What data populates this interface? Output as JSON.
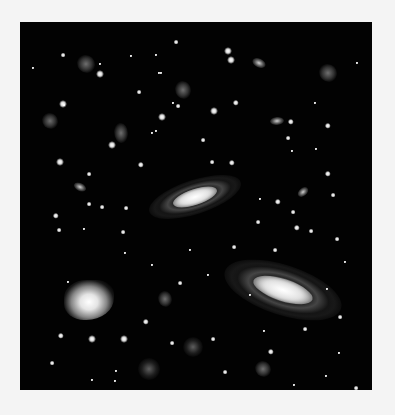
{
  "image": {
    "description": "Deep-field astronomical image of stars and galaxies on a black background",
    "panel": {
      "x": 20,
      "y": 22,
      "width": 352,
      "height": 368,
      "background": "#020202"
    },
    "border_color": "#f4f4f4"
  },
  "spiral_galaxies": [
    {
      "x": 195,
      "y": 197,
      "w": 96,
      "h": 34,
      "rot": -18,
      "core_w": 46,
      "core_h": 16
    },
    {
      "x": 283,
      "y": 290,
      "w": 122,
      "h": 50,
      "rot": 18,
      "core_w": 62,
      "core_h": 22
    }
  ],
  "small_galaxies": [
    {
      "x": 259,
      "y": 63,
      "w": 14,
      "h": 9,
      "rot": 25
    },
    {
      "x": 277,
      "y": 121,
      "w": 14,
      "h": 8,
      "rot": -5
    },
    {
      "x": 80,
      "y": 187,
      "w": 13,
      "h": 8,
      "rot": 25
    },
    {
      "x": 303,
      "y": 192,
      "w": 12,
      "h": 8,
      "rot": -40
    }
  ],
  "irregular_galaxies": [
    {
      "x": 86,
      "y": 64,
      "w": 18,
      "h": 18
    },
    {
      "x": 183,
      "y": 90,
      "w": 16,
      "h": 18
    },
    {
      "x": 328,
      "y": 73,
      "w": 18,
      "h": 18
    },
    {
      "x": 50,
      "y": 121,
      "w": 16,
      "h": 16
    },
    {
      "x": 121,
      "y": 133,
      "w": 14,
      "h": 20
    },
    {
      "x": 165,
      "y": 299,
      "w": 14,
      "h": 16
    },
    {
      "x": 263,
      "y": 369,
      "w": 16,
      "h": 16
    }
  ],
  "bright_nebula": {
    "x": 89,
    "y": 300,
    "w": 50,
    "h": 40
  },
  "diffuse_glows": [
    {
      "x": 193,
      "y": 347,
      "r": 10
    },
    {
      "x": 149,
      "y": 369,
      "r": 11
    }
  ],
  "stars": [
    {
      "x": 63,
      "y": 55,
      "s": 3
    },
    {
      "x": 131,
      "y": 56,
      "s": 2
    },
    {
      "x": 176,
      "y": 42,
      "s": 3
    },
    {
      "x": 64,
      "y": 105,
      "s": 2
    },
    {
      "x": 100,
      "y": 64,
      "s": 2
    },
    {
      "x": 228,
      "y": 51,
      "s": 5
    },
    {
      "x": 100,
      "y": 74,
      "s": 5
    },
    {
      "x": 156,
      "y": 55,
      "s": 2
    },
    {
      "x": 159,
      "y": 73,
      "s": 2
    },
    {
      "x": 231,
      "y": 60,
      "s": 5
    },
    {
      "x": 161,
      "y": 73,
      "s": 2
    },
    {
      "x": 173,
      "y": 103,
      "s": 2
    },
    {
      "x": 63,
      "y": 104,
      "s": 5
    },
    {
      "x": 139,
      "y": 92,
      "s": 3
    },
    {
      "x": 162,
      "y": 117,
      "s": 5
    },
    {
      "x": 178,
      "y": 106,
      "s": 3
    },
    {
      "x": 214,
      "y": 111,
      "s": 5
    },
    {
      "x": 236,
      "y": 103,
      "s": 4
    },
    {
      "x": 112,
      "y": 145,
      "s": 5
    },
    {
      "x": 156,
      "y": 131,
      "s": 2
    },
    {
      "x": 291,
      "y": 122,
      "s": 4
    },
    {
      "x": 288,
      "y": 138,
      "s": 3
    },
    {
      "x": 328,
      "y": 126,
      "s": 4
    },
    {
      "x": 316,
      "y": 149,
      "s": 2
    },
    {
      "x": 60,
      "y": 162,
      "s": 5
    },
    {
      "x": 89,
      "y": 174,
      "s": 3
    },
    {
      "x": 89,
      "y": 204,
      "s": 3
    },
    {
      "x": 102,
      "y": 207,
      "s": 3
    },
    {
      "x": 125,
      "y": 253,
      "s": 2
    },
    {
      "x": 56,
      "y": 216,
      "s": 4
    },
    {
      "x": 59,
      "y": 230,
      "s": 3
    },
    {
      "x": 123,
      "y": 232,
      "s": 3
    },
    {
      "x": 126,
      "y": 208,
      "s": 3
    },
    {
      "x": 141,
      "y": 165,
      "s": 4
    },
    {
      "x": 152,
      "y": 133,
      "s": 2
    },
    {
      "x": 212,
      "y": 162,
      "s": 3
    },
    {
      "x": 232,
      "y": 163,
      "s": 4
    },
    {
      "x": 203,
      "y": 140,
      "s": 3
    },
    {
      "x": 292,
      "y": 151,
      "s": 2
    },
    {
      "x": 328,
      "y": 174,
      "s": 4
    },
    {
      "x": 278,
      "y": 202,
      "s": 4
    },
    {
      "x": 293,
      "y": 212,
      "s": 3
    },
    {
      "x": 333,
      "y": 195,
      "s": 3
    },
    {
      "x": 258,
      "y": 222,
      "s": 3
    },
    {
      "x": 297,
      "y": 228,
      "s": 4
    },
    {
      "x": 311,
      "y": 231,
      "s": 3
    },
    {
      "x": 337,
      "y": 239,
      "s": 3
    },
    {
      "x": 275,
      "y": 250,
      "s": 3
    },
    {
      "x": 260,
      "y": 199,
      "s": 2
    },
    {
      "x": 234,
      "y": 247,
      "s": 3
    },
    {
      "x": 84,
      "y": 229,
      "s": 2
    },
    {
      "x": 180,
      "y": 283,
      "s": 3
    },
    {
      "x": 146,
      "y": 322,
      "s": 4
    },
    {
      "x": 172,
      "y": 343,
      "s": 3
    },
    {
      "x": 213,
      "y": 339,
      "s": 3
    },
    {
      "x": 271,
      "y": 352,
      "s": 4
    },
    {
      "x": 61,
      "y": 336,
      "s": 4
    },
    {
      "x": 92,
      "y": 339,
      "s": 5
    },
    {
      "x": 124,
      "y": 339,
      "s": 5
    },
    {
      "x": 52,
      "y": 363,
      "s": 3
    },
    {
      "x": 92,
      "y": 380,
      "s": 2
    },
    {
      "x": 116,
      "y": 371,
      "s": 2
    },
    {
      "x": 305,
      "y": 329,
      "s": 3
    },
    {
      "x": 339,
      "y": 353,
      "s": 2
    },
    {
      "x": 326,
      "y": 376,
      "s": 2
    },
    {
      "x": 356,
      "y": 388,
      "s": 3
    },
    {
      "x": 294,
      "y": 385,
      "s": 2
    },
    {
      "x": 264,
      "y": 331,
      "s": 2
    },
    {
      "x": 250,
      "y": 295,
      "s": 2
    },
    {
      "x": 327,
      "y": 289,
      "s": 2
    },
    {
      "x": 225,
      "y": 372,
      "s": 3
    },
    {
      "x": 115,
      "y": 381,
      "s": 2
    },
    {
      "x": 315,
      "y": 103,
      "s": 2
    },
    {
      "x": 357,
      "y": 63,
      "s": 2
    },
    {
      "x": 33,
      "y": 68,
      "s": 2
    },
    {
      "x": 345,
      "y": 262,
      "s": 2
    },
    {
      "x": 340,
      "y": 317,
      "s": 3
    },
    {
      "x": 190,
      "y": 250,
      "s": 2
    },
    {
      "x": 152,
      "y": 265,
      "s": 2
    },
    {
      "x": 208,
      "y": 275,
      "s": 2
    },
    {
      "x": 68,
      "y": 282,
      "s": 2
    }
  ]
}
